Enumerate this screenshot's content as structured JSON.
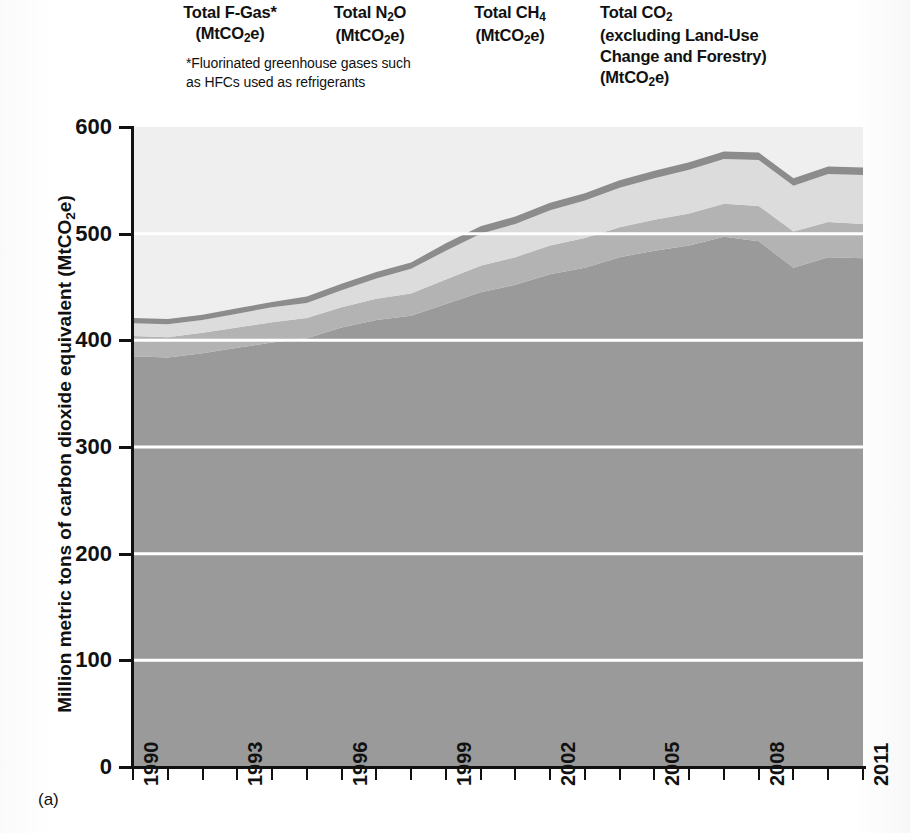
{
  "panel_label": "(a)",
  "legend": {
    "entries": [
      {
        "name": "f-gas",
        "line1": "Total F-Gas*",
        "line2": "(MtCO₂e)"
      },
      {
        "name": "n2o",
        "line1": "Total N₂O",
        "line2": "(MtCO₂e)"
      },
      {
        "name": "ch4",
        "line1": "Total CH₄",
        "line2": "(MtCO₂e)"
      },
      {
        "name": "co2",
        "line1": "Total CO₂",
        "line2": "(excluding Land-Use",
        "line3": "Change and Forestry)",
        "line4": "(MtCO₂e)"
      }
    ],
    "footnote_line1": "*Fluorinated greenhouse gases such",
    "footnote_line2": "as HFCs used as refrigerants"
  },
  "chart_data": {
    "type": "area",
    "stacked": true,
    "title": "",
    "xlabel": "",
    "ylabel": "Million metric tons of carbon dioxide equivalent (MtCO₂e)",
    "xlim": [
      1990,
      2011
    ],
    "ylim": [
      0,
      600
    ],
    "ytick_values": [
      0,
      100,
      200,
      300,
      400,
      500,
      600
    ],
    "ytick_labels": [
      "0",
      "100",
      "200",
      "300",
      "400",
      "500",
      "600"
    ],
    "xtick_values": [
      1990,
      1991,
      1992,
      1993,
      1994,
      1995,
      1996,
      1997,
      1998,
      1999,
      2000,
      2001,
      2002,
      2003,
      2004,
      2005,
      2006,
      2007,
      2008,
      2009,
      2010,
      2011
    ],
    "xtick_labels_shown": [
      "1990",
      "1993",
      "1996",
      "1999",
      "2002",
      "2005",
      "2008",
      "2011"
    ],
    "grid": "horizontal-white-lines",
    "legend_position": "above-plot",
    "x": [
      1990,
      1991,
      1992,
      1993,
      1994,
      1995,
      1996,
      1997,
      1998,
      1999,
      2000,
      2001,
      2002,
      2003,
      2004,
      2005,
      2006,
      2007,
      2008,
      2009,
      2010,
      2011
    ],
    "series": [
      {
        "name": "Total CO₂ (excluding Land-Use Change and Forestry)",
        "color": "#9a9a9a",
        "values": [
          385,
          384,
          388,
          393,
          398,
          402,
          412,
          419,
          423,
          434,
          445,
          452,
          462,
          468,
          478,
          484,
          489,
          497,
          493,
          468,
          478,
          477
        ]
      },
      {
        "name": "Total CH₄",
        "color": "#b3b3b3",
        "values": [
          19,
          19,
          19,
          19,
          19,
          19,
          19,
          20,
          21,
          23,
          25,
          26,
          27,
          28,
          28,
          29,
          30,
          31,
          33,
          34,
          33,
          32
        ]
      },
      {
        "name": "Total N₂O",
        "color": "#dcdcdc",
        "values": [
          12,
          12,
          12,
          13,
          14,
          14,
          16,
          19,
          23,
          27,
          30,
          31,
          33,
          35,
          37,
          39,
          41,
          42,
          43,
          43,
          45,
          46
        ]
      },
      {
        "name": "Total F-Gas*",
        "color": "#8c8c8c",
        "values": [
          5,
          5,
          5,
          5,
          5,
          6,
          6,
          6,
          6,
          7,
          7,
          7,
          7,
          7,
          7,
          7,
          7,
          7,
          7,
          7,
          7,
          7
        ]
      }
    ],
    "totals": [
      421,
      420,
      424,
      430,
      436,
      441,
      453,
      464,
      473,
      491,
      507,
      516,
      529,
      538,
      550,
      559,
      567,
      577,
      576,
      552,
      563,
      562
    ],
    "plot_background": "#efefef",
    "gridline_color": "#ffffff"
  }
}
